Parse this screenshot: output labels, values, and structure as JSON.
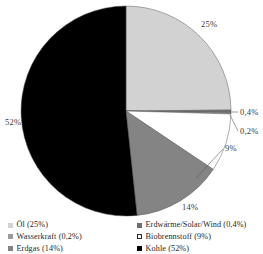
{
  "chart_data": {
    "type": "pie",
    "title": "",
    "subtitle": "",
    "xlabel": "",
    "ylabel": "",
    "legend_position": "bottom",
    "grid": false,
    "start_angle_deg": 0,
    "direction": "clockwise",
    "categories": [
      "Öl",
      "Erdwärme/Solar/Wind",
      "Wasserkraft",
      "Biobrennstoff",
      "Erdgas",
      "Kohle"
    ],
    "values": [
      25,
      0.4,
      0.2,
      9,
      14,
      52
    ],
    "value_labels": [
      "25%",
      "0,4%",
      "0,2%",
      "9%",
      "14%",
      "52%"
    ],
    "colors": [
      "#d2d2d2",
      "#6e6e6e",
      "#9a9a9a",
      "#ffffff",
      "#848484",
      "#000000"
    ],
    "slices": [
      {
        "name": "Öl",
        "value": 25,
        "label": "25%",
        "color": "#d2d2d2"
      },
      {
        "name": "Erdwärme/Solar/Wind",
        "value": 0.4,
        "label": "0,4%",
        "color": "#6e6e6e"
      },
      {
        "name": "Wasserkraft",
        "value": 0.2,
        "label": "0,2%",
        "color": "#9a9a9a"
      },
      {
        "name": "Biobrennstoff",
        "value": 9,
        "label": "9%",
        "color": "#ffffff"
      },
      {
        "name": "Erdgas",
        "value": 14,
        "label": "14%",
        "color": "#848484"
      },
      {
        "name": "Kohle",
        "value": 52,
        "label": "52%",
        "color": "#000000"
      }
    ],
    "annotations": [
      "25%",
      "0,4%",
      "0,2%",
      "9%",
      "14%",
      "52%"
    ]
  },
  "callouts": {
    "oel": "25%",
    "erdwaerme": "0,4%",
    "wasserkraft": "0,2%",
    "biobrennstoff": "9%",
    "erdgas": "14%",
    "kohle": "52%"
  },
  "legend": {
    "left_column": [
      {
        "label": "Öl (25%)",
        "color": "#d2d2d2",
        "bordered": false
      },
      {
        "label": "Wasserkraft (0,2%)",
        "color": "#9a9a9a",
        "bordered": false
      },
      {
        "label": "Erdgas (14%)",
        "color": "#848484",
        "bordered": false
      }
    ],
    "right_column": [
      {
        "label": "Erdwärme/Solar/Wind (0,4%)",
        "color": "#6e6e6e",
        "bordered": false
      },
      {
        "label": "Biobrennstoff (9%)",
        "color": "#ffffff",
        "bordered": true
      },
      {
        "label": "Kohle (52%)",
        "color": "#000000",
        "bordered": false
      }
    ]
  }
}
